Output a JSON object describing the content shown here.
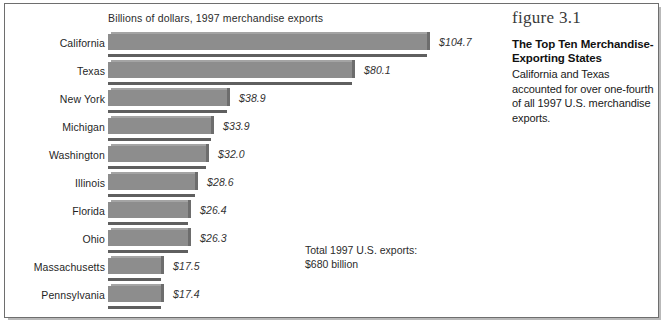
{
  "figure": {
    "number_label": "figure 3.1",
    "title": "The Top Ten Merchandise-Exporting States",
    "body": "California and Texas accounted for over one-fourth of all 1997 U.S. merchandise exports."
  },
  "chart_header": "Billions of dollars, 1997 merchandise exports",
  "total_note_line1": "Total 1997 U.S. exports:",
  "total_note_line2": "$680 billion",
  "chart_data": {
    "type": "bar",
    "orientation": "horizontal",
    "title": "The Top Ten Merchandise-Exporting States",
    "subtitle": "Billions of dollars, 1997 merchandise exports",
    "xlabel": "Billions of dollars",
    "ylabel": "",
    "xlim": [
      0,
      104.7
    ],
    "grid": false,
    "legend": false,
    "categories": [
      "California",
      "Texas",
      "New York",
      "Michigan",
      "Washington",
      "Illinois",
      "Florida",
      "Ohio",
      "Massachusetts",
      "Pennsylvania"
    ],
    "values": [
      104.7,
      80.1,
      38.9,
      33.9,
      32.0,
      28.6,
      26.4,
      26.3,
      17.5,
      17.4
    ],
    "data_labels": [
      "$104.7",
      "$80.1",
      "$38.9",
      "$33.9",
      "$32.0",
      "$28.6",
      "$26.4",
      "$26.3",
      "$17.5",
      "$17.4"
    ],
    "annotations": [
      "Total 1997 U.S. exports: $680 billion"
    ],
    "bar_color": "#8d8d8d"
  },
  "rows": [
    {
      "label": "California",
      "value_label": "$104.7",
      "bar_px": 319
    },
    {
      "label": "Texas",
      "value_label": "$80.1",
      "bar_px": 244
    },
    {
      "label": "New York",
      "value_label": "$38.9",
      "bar_px": 119
    },
    {
      "label": "Michigan",
      "value_label": "$33.9",
      "bar_px": 103
    },
    {
      "label": "Washington",
      "value_label": "$32.0",
      "bar_px": 98
    },
    {
      "label": "Illinois",
      "value_label": "$28.6",
      "bar_px": 87
    },
    {
      "label": "Florida",
      "value_label": "$26.4",
      "bar_px": 80
    },
    {
      "label": "Ohio",
      "value_label": "$26.3",
      "bar_px": 80
    },
    {
      "label": "Massachusetts",
      "value_label": "$17.5",
      "bar_px": 53
    },
    {
      "label": "Pennsylvania",
      "value_label": "$17.4",
      "bar_px": 53
    }
  ]
}
